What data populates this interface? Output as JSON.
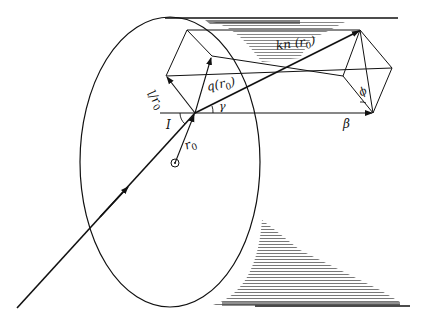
{
  "figure": {
    "type": "ray geometry in optical fiber (skew ray)",
    "labels": {
      "kn": "kn",
      "kn_arg_open": "(",
      "kn_arg_r": "r",
      "kn_arg_sub": "0",
      "kn_arg_close": ")",
      "q": "q",
      "q_arg_open": "(",
      "q_arg_r": "r",
      "q_arg_sub": "0",
      "q_arg_close": ")",
      "l_over": "l/",
      "l_r": "r",
      "l_sub": "0",
      "I": "I",
      "gamma": "γ",
      "beta": "β",
      "phi": "ϕ",
      "r0_r": "r",
      "r0_sub": "0"
    },
    "colors": {
      "line": "#111111",
      "background": "#ffffff",
      "hatch": "#555555"
    }
  }
}
